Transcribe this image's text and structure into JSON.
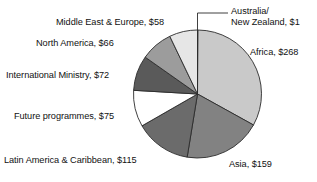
{
  "chart_data": {
    "type": "pie",
    "title": "",
    "subtitle": "",
    "units": "$ millions",
    "total": 814,
    "start_angle_deg": 0,
    "direction": "clockwise",
    "legend": "none",
    "labels_position": "outside",
    "grid": false,
    "categories": [
      "Australia/ New Zealand",
      "Africa",
      "Asia",
      "Latin America & Caribbean",
      "Future programmes",
      "International Ministry",
      "North America",
      "Middle East & Europe"
    ],
    "values": [
      1,
      268,
      159,
      115,
      75,
      72,
      66,
      58
    ],
    "value_labels": [
      "$1",
      "$268",
      "$159",
      "$115",
      "$75",
      "$72",
      "$66",
      "$58"
    ],
    "slice_colors": [
      "#ffffff",
      "#c9c9c9",
      "#828282",
      "#6b6b6b",
      "#ffffff",
      "#5a5a5a",
      "#9c9c9c",
      "#e6e6e6"
    ],
    "slice_stroke": "#2b2b2b",
    "annotations": [
      {
        "name": "australia-leader-line",
        "text": "Australia/ New Zealand, $1",
        "has_leader_line": true
      }
    ]
  },
  "labels": {
    "australia_line1": "Australia/",
    "australia_line2": "New Zealand, $1",
    "africa": "Africa, $268",
    "asia": "Asia, $159",
    "latin_america": "Latin America & Caribbean, $115",
    "future_programmes": "Future programmes, $75",
    "international_ministry": "International Ministry, $72",
    "north_america": "North America, $66",
    "middle_east_europe": "Middle East & Europe, $58"
  }
}
